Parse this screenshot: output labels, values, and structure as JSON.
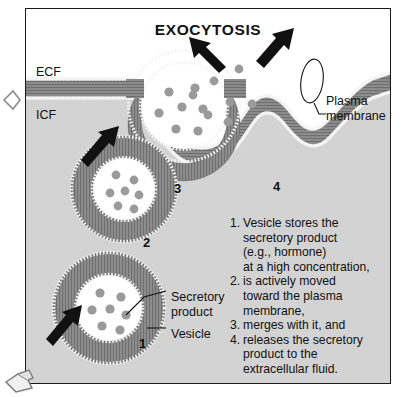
{
  "figure": {
    "title": "EXOCYTOSIS",
    "compartments": {
      "extracellular_label": "ECF",
      "intracellular_label": "ICF"
    },
    "stage_numbers": {
      "one": "1",
      "two": "2",
      "three": "3",
      "four": "4"
    },
    "callouts": {
      "secretory_product": "Secretory\nproduct",
      "secretory_product_line1": "Secretory",
      "secretory_product_line2": "product",
      "vesicle": "Vesicle",
      "plasma_membrane_line1": "Plasma",
      "plasma_membrane_line2": "membrane"
    },
    "steps": [
      {
        "marker": "1.",
        "lines": [
          "Vesicle stores the",
          "secretory product",
          "(e.g., hormone)",
          "at a high concentration,"
        ]
      },
      {
        "marker": "2.",
        "lines": [
          "is actively moved",
          "toward the plasma",
          "membrane,"
        ]
      },
      {
        "marker": "3.",
        "lines": [
          "merges with it, and"
        ]
      },
      {
        "marker": "4.",
        "lines": [
          "releases the secretory",
          "product to the",
          "extracellular fluid."
        ]
      }
    ],
    "colors": {
      "extracellular_fluid": "#ffffff",
      "cytosol": "#d3d3d3",
      "membrane_tails": "#8a8a8a",
      "membrane_heads": "#f2f2f2",
      "granule": "#9a9a9a",
      "arrow": "#111111",
      "text": "#111111",
      "border": "#1a1a1a"
    },
    "icons": {
      "motion_arrow": "arrow-up-right",
      "release_arrow_left": "arrow-up-left",
      "release_arrow_right": "arrow-up-right",
      "membrane_callout_ring": "ellipse-highlight"
    }
  }
}
